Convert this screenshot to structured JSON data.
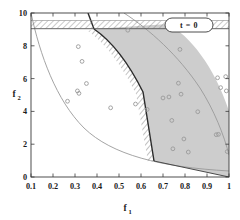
{
  "chart_data": {
    "type": "scatter",
    "title": "",
    "xlabel": "f1",
    "xlabel_base": "f",
    "xlabel_sub": "1",
    "ylabel": "f2",
    "ylabel_base": "f",
    "ylabel_sub": "2",
    "xlim": [
      0.1,
      1.0
    ],
    "ylim": [
      0,
      10
    ],
    "xticks": [
      0.1,
      0.2,
      0.3,
      0.4,
      0.5,
      0.6,
      0.7,
      0.8,
      0.9,
      1
    ],
    "xticklabels": [
      "0.1",
      "0.2",
      "0.3",
      "0.4",
      "0.5",
      "0.6",
      "0.7",
      "0.8",
      "0.9",
      "1"
    ],
    "yticks": [
      0,
      2,
      4,
      6,
      8,
      10
    ],
    "yticklabels": [
      "0",
      "2",
      "4",
      "6",
      "8",
      "10"
    ],
    "grid": false,
    "ticks_all_sides": true,
    "tick_direction": "in",
    "annotation": "t = 0",
    "legend_position": "top-right",
    "marker": "open-circle",
    "marker_color": "#9a9a9a",
    "feasible_fill": "#cdcdcd",
    "constraint_hatch_color": "#808080",
    "points": [
      {
        "f1": 0.315,
        "f2": 7.95
      },
      {
        "f1": 0.332,
        "f2": 7.05
      },
      {
        "f1": 0.352,
        "f2": 5.7
      },
      {
        "f1": 0.311,
        "f2": 5.25
      },
      {
        "f1": 0.318,
        "f2": 5.1
      },
      {
        "f1": 0.266,
        "f2": 4.62
      },
      {
        "f1": 0.462,
        "f2": 4.22
      },
      {
        "f1": 0.54,
        "f2": 8.95
      },
      {
        "f1": 0.575,
        "f2": 4.45
      },
      {
        "f1": 0.628,
        "f2": 4.12
      },
      {
        "f1": 0.7,
        "f2": 4.82
      },
      {
        "f1": 0.727,
        "f2": 4.88
      },
      {
        "f1": 0.74,
        "f2": 3.45
      },
      {
        "f1": 0.745,
        "f2": 1.72
      },
      {
        "f1": 0.77,
        "f2": 5.72
      },
      {
        "f1": 0.777,
        "f2": 7.78
      },
      {
        "f1": 0.782,
        "f2": 5.05
      },
      {
        "f1": 0.795,
        "f2": 2.32
      },
      {
        "f1": 0.815,
        "f2": 1.52
      },
      {
        "f1": 0.858,
        "f2": 3.98
      },
      {
        "f1": 0.942,
        "f2": 2.58
      },
      {
        "f1": 0.952,
        "f2": 2.6
      },
      {
        "f1": 0.948,
        "f2": 6.05
      },
      {
        "f1": 0.962,
        "f2": 5.45
      },
      {
        "f1": 0.985,
        "f2": 6.12
      },
      {
        "f1": 0.988,
        "f2": 5.25
      },
      {
        "f1": 0.992,
        "f2": 1.55
      }
    ],
    "curves": [
      {
        "name": "lower-objective-boundary",
        "style": "thin-solid-gray"
      },
      {
        "name": "upper-objective-boundary",
        "style": "thin-solid-gray"
      },
      {
        "name": "constraint-g1-boundary",
        "style": "thick-solid-black-hatched"
      },
      {
        "name": "constraint-g2-boundary",
        "style": "horizontal-hatched-band"
      }
    ]
  },
  "legend": {
    "label": "t = 0"
  }
}
